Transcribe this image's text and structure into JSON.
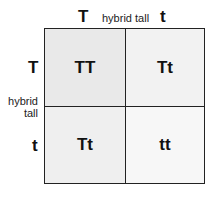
{
  "top": {
    "allele_left": "T",
    "label": "hybrid tall",
    "allele_right": "t"
  },
  "side": {
    "allele_top": "T",
    "label_line1": "hybrid",
    "label_line2": "tall",
    "allele_bottom": "t"
  },
  "cells": [
    {
      "genotype": "TT"
    },
    {
      "genotype": "Tt"
    },
    {
      "genotype": "Tt"
    },
    {
      "genotype": "tt"
    }
  ]
}
